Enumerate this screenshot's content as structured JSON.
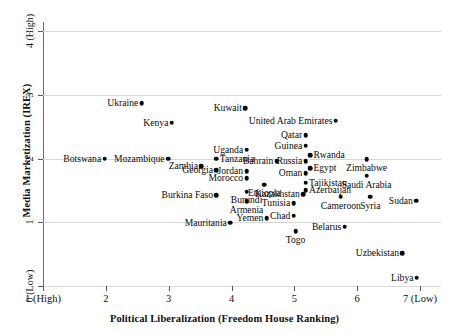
{
  "chart_data": {
    "type": "scatter",
    "title": "",
    "xlabel": "Political Liberalization (Freedom House Ranking)",
    "ylabel": "Media Marketization (IREX)",
    "xlim": [
      1,
      7
    ],
    "ylim": [
      0,
      4.15
    ],
    "grid": true,
    "legend": "none",
    "xticks": [
      {
        "value": 1,
        "label": "1 (High)"
      },
      {
        "value": 2,
        "label": "2"
      },
      {
        "value": 3,
        "label": "3"
      },
      {
        "value": 4,
        "label": "4"
      },
      {
        "value": 5,
        "label": "5"
      },
      {
        "value": 6,
        "label": "6"
      },
      {
        "value": 7,
        "label": "7 (Low)"
      }
    ],
    "yticks": [
      {
        "value": 0,
        "label": "0 (Low)"
      },
      {
        "value": 1,
        "label": "1"
      },
      {
        "value": 2,
        "label": "2"
      },
      {
        "value": 3,
        "label": "3"
      },
      {
        "value": 4,
        "label": "4 (High)"
      }
    ],
    "point_color": "#0a0a0a",
    "grid_color": "#d8d8d8",
    "axis_color": "#6b6b6b",
    "points": [
      {
        "label": "Ukraine",
        "x": 2.57,
        "y": 2.87,
        "pos": "left"
      },
      {
        "label": "Kenya",
        "x": 3.05,
        "y": 2.56,
        "pos": "left"
      },
      {
        "label": "Kuwait",
        "x": 4.22,
        "y": 2.79,
        "pos": "left"
      },
      {
        "label": "United Arab Emirates",
        "x": 5.66,
        "y": 2.59,
        "pos": "left"
      },
      {
        "label": "Qatar",
        "x": 5.18,
        "y": 2.37,
        "pos": "left"
      },
      {
        "label": "Guinea",
        "x": 5.18,
        "y": 2.2,
        "pos": "left"
      },
      {
        "label": "Uganda",
        "x": 4.24,
        "y": 2.14,
        "pos": "left"
      },
      {
        "label": "Rwanda",
        "x": 5.25,
        "y": 2.05,
        "pos": "right"
      },
      {
        "label": "Botswana",
        "x": 1.98,
        "y": 2.0,
        "pos": "left"
      },
      {
        "label": "Mozambique",
        "x": 2.99,
        "y": 2.0,
        "pos": "left"
      },
      {
        "label": "Tanzania",
        "x": 3.76,
        "y": 2.0,
        "pos": "right"
      },
      {
        "label": "Bahrain",
        "x": 4.72,
        "y": 1.96,
        "pos": "left"
      },
      {
        "label": "Russia",
        "x": 5.18,
        "y": 1.96,
        "pos": "left"
      },
      {
        "label": "Zimbabwe",
        "x": 6.15,
        "y": 1.99,
        "pos": "below"
      },
      {
        "label": "Zambia",
        "x": 3.52,
        "y": 1.88,
        "pos": "left"
      },
      {
        "label": "Egypt",
        "x": 5.25,
        "y": 1.85,
        "pos": "right"
      },
      {
        "label": "Georgia",
        "x": 3.76,
        "y": 1.82,
        "pos": "left"
      },
      {
        "label": "Jordan",
        "x": 4.24,
        "y": 1.8,
        "pos": "left"
      },
      {
        "label": "Oman",
        "x": 5.18,
        "y": 1.77,
        "pos": "left"
      },
      {
        "label": "Morocco",
        "x": 4.24,
        "y": 1.69,
        "pos": "left"
      },
      {
        "label": "Saudi Arabia",
        "x": 6.15,
        "y": 1.73,
        "pos": "below"
      },
      {
        "label": "Tajikistan",
        "x": 5.18,
        "y": 1.62,
        "pos": "right"
      },
      {
        "label": "Ethiopia",
        "x": 4.52,
        "y": 1.59,
        "pos": "below"
      },
      {
        "label": "Azerbaijan",
        "x": 5.18,
        "y": 1.5,
        "pos": "right"
      },
      {
        "label": "Burundi",
        "x": 4.24,
        "y": 1.48,
        "pos": "below"
      },
      {
        "label": "Burkina Faso",
        "x": 3.76,
        "y": 1.42,
        "pos": "left"
      },
      {
        "label": "Kazakhstan",
        "x": 5.14,
        "y": 1.44,
        "pos": "left"
      },
      {
        "label": "Armenia",
        "x": 4.24,
        "y": 1.33,
        "pos": "below"
      },
      {
        "label": "Syria",
        "x": 6.21,
        "y": 1.4,
        "pos": "below"
      },
      {
        "label": "Cameroon",
        "x": 5.74,
        "y": 1.4,
        "pos": "below"
      },
      {
        "label": "Tunisia",
        "x": 4.99,
        "y": 1.3,
        "pos": "left"
      },
      {
        "label": "Sudan",
        "x": 6.94,
        "y": 1.34,
        "pos": "left"
      },
      {
        "label": "Yemen",
        "x": 4.56,
        "y": 1.06,
        "pos": "left"
      },
      {
        "label": "Chad",
        "x": 4.99,
        "y": 1.1,
        "pos": "left"
      },
      {
        "label": "Mauritania",
        "x": 3.98,
        "y": 0.99,
        "pos": "left"
      },
      {
        "label": "Togo",
        "x": 5.02,
        "y": 0.86,
        "pos": "below"
      },
      {
        "label": "Belarus",
        "x": 5.8,
        "y": 0.93,
        "pos": "left"
      },
      {
        "label": "Uzbekistan",
        "x": 6.72,
        "y": 0.51,
        "pos": "left"
      },
      {
        "label": "Libya",
        "x": 6.95,
        "y": 0.13,
        "pos": "left"
      }
    ]
  }
}
